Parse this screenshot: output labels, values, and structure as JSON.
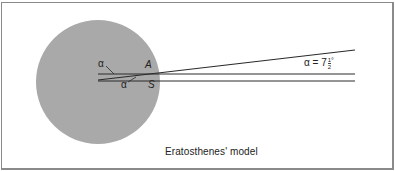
{
  "diagram": {
    "title": "Eratosthenes' model",
    "earth": {
      "color": "#a9a9a9"
    },
    "line_color": "#2a2a2a",
    "frame_color": "#8a8a8a",
    "labels": {
      "alpha_top": "α",
      "alpha_bottom": "α",
      "point_a": "A",
      "point_s": "S",
      "angle_eq_prefix": "α = 7",
      "angle_frac_num": "1",
      "angle_frac_den": "2",
      "angle_unit": "°"
    }
  }
}
